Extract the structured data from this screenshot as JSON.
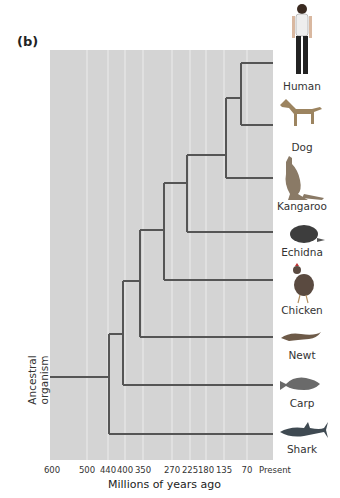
{
  "figure": {
    "panel_label": "(b)",
    "root_label_line1": "Ancestral",
    "root_label_line2": "organism",
    "x_axis_label": "Millions of years ago",
    "x_ticks": [
      "600",
      "500",
      "440",
      "400",
      "350",
      "270",
      "225",
      "180",
      "135",
      "70",
      "Present"
    ],
    "taxa": [
      {
        "name": "Human",
        "icon": "human-icon"
      },
      {
        "name": "Dog",
        "icon": "dog-icon"
      },
      {
        "name": "Kangaroo",
        "icon": "kangaroo-icon"
      },
      {
        "name": "Echidna",
        "icon": "echidna-icon"
      },
      {
        "name": "Chicken",
        "icon": "chicken-icon"
      },
      {
        "name": "Newt",
        "icon": "newt-icon"
      },
      {
        "name": "Carp",
        "icon": "carp-icon"
      },
      {
        "name": "Shark",
        "icon": "shark-icon"
      }
    ],
    "colors": {
      "plot_background": "#d4d4d4",
      "gridline": "#ececec",
      "branch": "#555555"
    }
  }
}
